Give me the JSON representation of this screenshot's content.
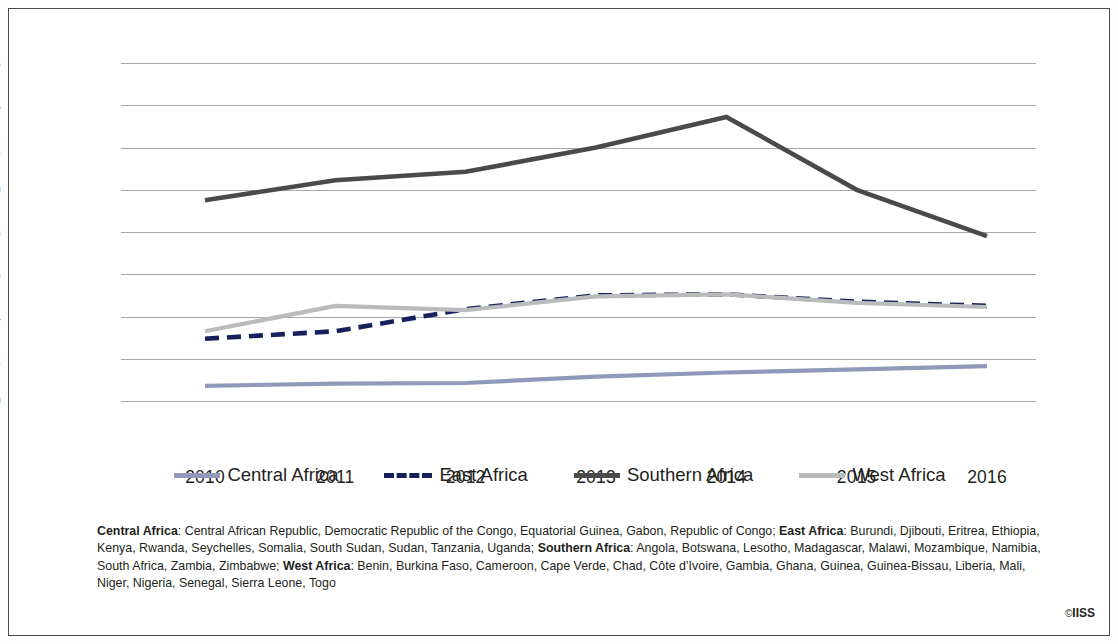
{
  "chart_data": {
    "type": "line",
    "title": "",
    "subtitle": "",
    "xlabel": "",
    "ylabel": "",
    "x": [
      2010,
      2011,
      2012,
      2013,
      2014,
      2015,
      2016
    ],
    "xtick_labels": [
      "2010",
      "2011",
      "2012",
      "2013",
      "2014",
      "2015",
      "2016"
    ],
    "ytick_labels": [
      "16",
      "14",
      "12",
      "10",
      "8",
      "6",
      "4",
      "2",
      "0"
    ],
    "ytick_values": [
      16,
      14,
      12,
      10,
      8,
      6,
      4,
      2,
      0
    ],
    "ylim": [
      0,
      16
    ],
    "grid": "horizontal",
    "legend_position": "bottom",
    "series": [
      {
        "name": "Central Africa",
        "color": "#9099bc",
        "style": "solid",
        "width": 4.2,
        "values": [
          0.72,
          0.82,
          0.85,
          1.15,
          1.35,
          1.5,
          1.65
        ]
      },
      {
        "name": "East Africa",
        "color": "#16215b",
        "style": "dashed",
        "width": 4.6,
        "values": [
          2.95,
          3.3,
          4.35,
          5.0,
          5.05,
          4.7,
          4.5
        ]
      },
      {
        "name": "Southern  Africa",
        "color": "#4a4a4a",
        "style": "solid",
        "width": 4.6,
        "values": [
          9.5,
          10.45,
          10.85,
          12.0,
          13.45,
          10.0,
          7.8
        ]
      },
      {
        "name": "West Africa",
        "color": "#b9bbbd",
        "style": "solid",
        "width": 4.2,
        "values": [
          3.3,
          4.5,
          4.3,
          4.95,
          5.05,
          4.65,
          4.45
        ]
      }
    ]
  },
  "legend": [
    {
      "label": "Central Africa",
      "color": "#9099bc",
      "style": "solid"
    },
    {
      "label": "East Africa",
      "color": "#16215b",
      "style": "dashed"
    },
    {
      "label": "Southern  Africa",
      "color": "#4a4a4a",
      "style": "solid"
    },
    {
      "label": "West Africa",
      "color": "#b9bbbd",
      "style": "solid"
    }
  ],
  "footnote": {
    "groups": [
      {
        "name": "Central Africa",
        "countries": "Central African Republic, Democratic Republic of the Congo, Equatorial Guinea, Gabon, Republic of Congo"
      },
      {
        "name": "East Africa",
        "countries": "Burundi, Djibouti, Eritrea, Ethiopia, Kenya, Rwanda, Seychelles, Somalia, South Sudan, Sudan, Tanzania, Uganda"
      },
      {
        "name": "Southern Africa",
        "countries": "Angola, Botswana, Lesotho, Madagascar, Malawi, Mozambique, Namibia, South Africa, Zambia, Zimbabwe"
      },
      {
        "name": "West Africa",
        "countries": "Benin, Burkina Faso, Cameroon, Cape Verde, Chad, Côte d’Ivoire, Gambia, Ghana, Guinea, Guinea-Bissau, Liberia, Mali, Niger, Nigeria, Senegal, Sierra Leone, Togo"
      }
    ]
  },
  "credit": {
    "symbol": "©",
    "text": "IISS"
  }
}
